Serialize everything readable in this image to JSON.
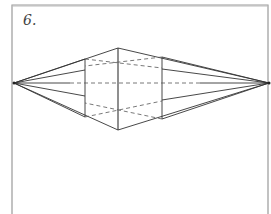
{
  "figure": {
    "label": "6.",
    "stroke_color": "#333333",
    "frame_color": "#999999",
    "vanishing_points": {
      "left": [
        14,
        83
      ],
      "right": [
        269,
        83
      ]
    },
    "horizon_y": 83,
    "vertical_edges": [
      {
        "name": "left-edge",
        "x": 85,
        "top": 59,
        "bottom": 117
      },
      {
        "name": "center-edge",
        "x": 118,
        "top": 48,
        "bottom": 130
      },
      {
        "name": "right-edge",
        "x": 162,
        "top": 57,
        "bottom": 119
      }
    ]
  }
}
